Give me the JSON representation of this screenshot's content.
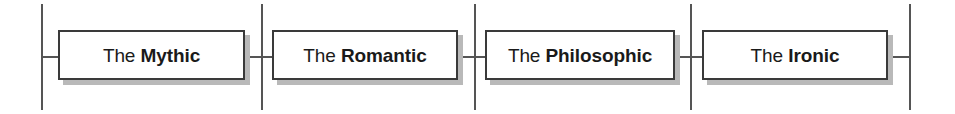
{
  "diagram": {
    "type": "timeline-stage-sequence",
    "background_color": "#ffffff",
    "line_color": "#555555",
    "box_border_color": "#3a3a3a",
    "box_fill_color": "#ffffff",
    "shadow_color": "#b9b9b9",
    "text_color": "#1a1a1a",
    "stages": [
      {
        "lead": "The",
        "key": "Mythic",
        "full": "The Mythic"
      },
      {
        "lead": "The",
        "key": "Romantic",
        "full": "The Romantic"
      },
      {
        "lead": "The",
        "key": "Philosophic",
        "full": "The Philosophic"
      },
      {
        "lead": "The",
        "key": "Ironic",
        "full": "The Ironic"
      }
    ],
    "divider_count": 5
  }
}
